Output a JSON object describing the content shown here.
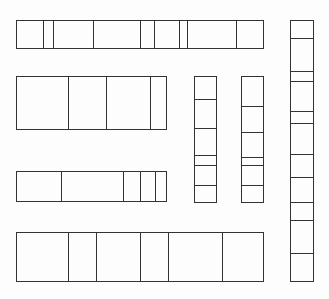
{
  "diagram": {
    "title": "",
    "stroke_color": "#333333",
    "background_color": "#fdfdfd",
    "strips": [
      {
        "id": "horizontal-strip-1",
        "orientation": "horizontal",
        "x": 16,
        "y": 20,
        "w": 248,
        "h": 29,
        "dividers": [
          43,
          53,
          93,
          140,
          154,
          179,
          187,
          236
        ]
      },
      {
        "id": "horizontal-strip-2",
        "orientation": "horizontal",
        "x": 16,
        "y": 76,
        "w": 151,
        "h": 54,
        "dividers": [
          68,
          106,
          150
        ]
      },
      {
        "id": "horizontal-strip-3",
        "orientation": "horizontal",
        "x": 16,
        "y": 171,
        "w": 151,
        "h": 31,
        "dividers": [
          61,
          123,
          140,
          155
        ]
      },
      {
        "id": "horizontal-strip-4",
        "orientation": "horizontal",
        "x": 16,
        "y": 232,
        "w": 248,
        "h": 50,
        "dividers": [
          68,
          96,
          140,
          168,
          222
        ]
      },
      {
        "id": "vertical-strip-1",
        "orientation": "vertical",
        "x": 194,
        "y": 76,
        "w": 23,
        "h": 127,
        "dividers": [
          99,
          128,
          155,
          165,
          185
        ]
      },
      {
        "id": "vertical-strip-2",
        "orientation": "vertical",
        "x": 241,
        "y": 76,
        "w": 23,
        "h": 127,
        "dividers": [
          106,
          132,
          157,
          165,
          185
        ]
      },
      {
        "id": "vertical-strip-3",
        "orientation": "vertical",
        "x": 290,
        "y": 20,
        "w": 24,
        "h": 262,
        "dividers": [
          38,
          71,
          81,
          111,
          123,
          154,
          177,
          202,
          220,
          253
        ]
      }
    ]
  }
}
